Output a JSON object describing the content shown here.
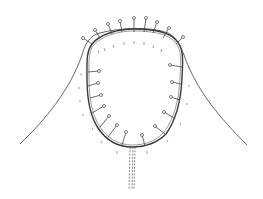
{
  "diagram": {
    "colors": {
      "line": "#444444",
      "background": "#ffffff"
    },
    "elements": [
      "sleeve-cap-curve",
      "armhole-oval",
      "pins",
      "ease-marks",
      "underarm-seam"
    ],
    "pin_count": 20
  }
}
